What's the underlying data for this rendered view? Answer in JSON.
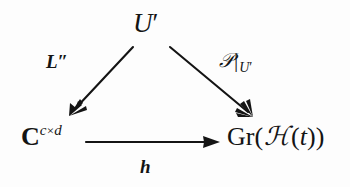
{
  "figure": {
    "kind": "commutative-triangle-diagram",
    "background_color": "#fdfdfd",
    "ink_color": "#141414"
  },
  "nodes": {
    "top": {
      "name": "U-prime",
      "base": "U",
      "prime": "′",
      "full_text": "U′"
    },
    "bottom_left": {
      "name": "complex-matrix-space",
      "base": "C",
      "superscript_row": "c",
      "superscript_times": "×",
      "superscript_col": "d",
      "full_text": "C^{c×d}"
    },
    "bottom_right": {
      "name": "grassmannian-of-script-H-of-t",
      "prefix": "Gr(",
      "script_h": "ℋ",
      "argument_open": "(",
      "variable": "t",
      "argument_close": ")",
      "suffix": ")",
      "full_text": "Gr(ℋ(t))"
    }
  },
  "edges": {
    "left": {
      "name": "edge-top-to-bottom-left",
      "from": "U′",
      "to": "C^{c×d}",
      "label_base": "L",
      "label_double_prime": "″",
      "label_full": "L″",
      "direction": "down-left"
    },
    "right": {
      "name": "edge-top-to-bottom-right",
      "from": "U′",
      "to": "Gr(ℋ(t))",
      "label_script_p": "𝒫",
      "label_restriction_bar": "|",
      "label_subscript": "U",
      "label_subscript_prime": "′",
      "label_full": "𝒫|_{U′}",
      "direction": "down-right"
    },
    "bottom": {
      "name": "edge-bottom-left-to-bottom-right",
      "from": "C^{c×d}",
      "to": "Gr(ℋ(t))",
      "label_full": "h",
      "direction": "right"
    }
  }
}
